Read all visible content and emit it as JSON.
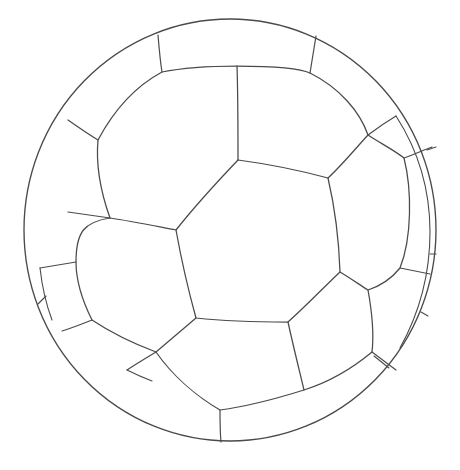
{
  "document": {
    "title": "Soccer Ball Line Drawing",
    "subject": "soccer-ball",
    "style": "black-and-white outline coloring page",
    "background_color": "#ffffff",
    "line_color": "#4a4a4a",
    "line_width_px": 1.25,
    "canvas": {
      "width": 460,
      "height": 470
    }
  },
  "ball": {
    "name": "soccer-ball",
    "center": {
      "x": 230,
      "y": 230
    },
    "radius_x": 206,
    "radius_y": 211,
    "outline": {
      "name": "ball-outer-circle",
      "cx": 230,
      "cy": 230,
      "rx": 206,
      "ry": 211
    },
    "panel_count": 20,
    "panels": [
      {
        "id": "center-hexagon",
        "label": "center hexagon panel",
        "kind": "hexagon",
        "points": "238,160 328,178 340,272 288,322 196,318 176,230"
      },
      {
        "id": "upper-left-hexagon",
        "label": "upper left hexagon panel",
        "kind": "hexagon",
        "points": "238,160 176,230 110,218 98,140 162,72 237,66"
      },
      {
        "id": "upper-right-pentagon",
        "label": "upper right pentagon panel",
        "kind": "pentagon",
        "points": "238,160 237,66 310,73 368,135 328,178"
      },
      {
        "id": "right-hexagon",
        "label": "right hexagon panel",
        "kind": "hexagon",
        "points": "328,178 368,135 404,158 400,268 368,290 340,272"
      },
      {
        "id": "left-hexagon",
        "label": "left mid hexagon panel",
        "kind": "hexagon",
        "points": "176,230 196,318 156,352 92,320 76,262 110,218"
      },
      {
        "id": "lower-center-pentagon",
        "label": "lower center pentagon panel",
        "kind": "pentagon",
        "points": "196,318 288,322 304,390 220,410 156,352"
      },
      {
        "id": "lower-right-hexagon",
        "label": "lower right hexagon panel",
        "kind": "hexagon",
        "points": "288,322 340,272 368,290 372,352 304,390"
      },
      {
        "id": "top-rim-left",
        "label": "top rim panel left",
        "kind": "rim"
      },
      {
        "id": "top-rim-center",
        "label": "top rim panel center",
        "kind": "rim"
      },
      {
        "id": "top-rim-right",
        "label": "top rim panel right",
        "kind": "rim"
      },
      {
        "id": "left-rim-upper",
        "label": "left rim panel upper",
        "kind": "rim"
      },
      {
        "id": "left-rim-lower",
        "label": "left rim panel lower",
        "kind": "rim"
      },
      {
        "id": "bottom-rim-left",
        "label": "bottom rim panel left",
        "kind": "rim"
      },
      {
        "id": "bottom-rim-right",
        "label": "bottom rim panel right",
        "kind": "rim"
      },
      {
        "id": "right-rim-upper",
        "label": "right rim sliver upper",
        "kind": "sliver"
      },
      {
        "id": "right-rim-lower",
        "label": "right rim sliver lower",
        "kind": "sliver"
      }
    ],
    "seams": [
      {
        "id": "seam-top-left-radial",
        "label": "top left radial seam"
      },
      {
        "id": "seam-top-right-radial",
        "label": "top right radial seam"
      },
      {
        "id": "seam-left-upper-radial",
        "label": "left upper radial seam"
      },
      {
        "id": "seam-left-lower-radial",
        "label": "left lower radial seam"
      },
      {
        "id": "seam-right-upper-radial",
        "label": "right upper radial seam"
      },
      {
        "id": "seam-right-lower-radial",
        "label": "right lower radial seam"
      },
      {
        "id": "seam-bottom-radial",
        "label": "bottom radial seam"
      },
      {
        "id": "seam-bottom-left-radial",
        "label": "bottom left radial seam"
      },
      {
        "id": "seam-bottom-right-radial",
        "label": "bottom right radial seam"
      }
    ],
    "inner_ring": {
      "name": "inner-panel-ring",
      "description": "arc boundary separating the face panels from the perimeter rim panels"
    }
  }
}
